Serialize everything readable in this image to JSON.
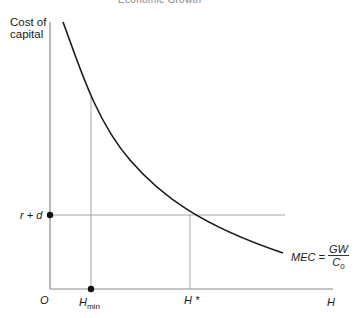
{
  "header": {
    "running_title": "Economic Growth"
  },
  "axes": {
    "y_label_line1": "Cost of",
    "y_label_line2": "capital",
    "x_label": "H",
    "origin": "O"
  },
  "markers": {
    "r_plus_d": "r + d",
    "h_min": "H",
    "h_min_sub": "min",
    "h_star": "H *"
  },
  "curve_label": {
    "lhs": "MEC =",
    "numerator": "GW",
    "denominator": "C",
    "denominator_sub": "0"
  },
  "colors": {
    "curve": "#1a1a1a",
    "axis": "#8a8a8a",
    "guide": "#9a9a9a",
    "dot": "#111111"
  }
}
